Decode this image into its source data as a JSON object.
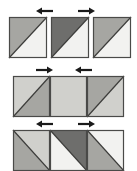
{
  "figure": {
    "type": "patchwork-pressing-diagram",
    "canvas": {
      "width": 137,
      "height": 171,
      "background": "#ffffff"
    },
    "colors": {
      "light": "#f2f2f0",
      "light_gray": "#d0d0cc",
      "medium_gray": "#a6a6a2",
      "dark_gray": "#6e6e6c",
      "outline": "#4a4a48",
      "arrow": "#1a1a1a",
      "seam_line": "#3c3c3a"
    },
    "rows": [
      {
        "name": "row-1-separate-units",
        "label": "Row 1 - three separate half-square triangle units",
        "joined": false,
        "y": 17,
        "x": 9,
        "unit_width": 38,
        "unit_height": 41,
        "gap": 4,
        "units": [
          {
            "name": "unit-1-1",
            "diagonal": "tr-bl",
            "upper_fill": "medium_gray",
            "lower_fill": "light"
          },
          {
            "name": "unit-1-2",
            "diagonal": "tr-bl",
            "upper_fill": "dark_gray",
            "lower_fill": "light"
          },
          {
            "name": "unit-1-3",
            "diagonal": "tr-bl",
            "upper_fill": "medium_gray",
            "lower_fill": "light"
          }
        ],
        "arrows": [
          {
            "name": "arrow-row1-left",
            "direction": "left",
            "x": 36,
            "y": 11,
            "length": 17
          },
          {
            "name": "arrow-row1-right",
            "direction": "right",
            "x": 78,
            "y": 11,
            "length": 17
          }
        ]
      },
      {
        "name": "row-2-joined-strip-light",
        "label": "Row 2 - units joined into a strip, seams pressed inward",
        "joined": true,
        "y": 76,
        "x": 13,
        "unit_width": 37,
        "unit_height": 41,
        "gap": 0,
        "units": [
          {
            "name": "unit-2-1",
            "diagonal": "tr-bl",
            "upper_fill": "light_gray",
            "lower_fill": "medium_gray"
          },
          {
            "name": "unit-2-2",
            "diagonal": "none",
            "upper_fill": "light_gray",
            "lower_fill": "light_gray"
          },
          {
            "name": "unit-2-3",
            "diagonal": "tr-bl",
            "upper_fill": "medium_gray",
            "lower_fill": "light_gray"
          }
        ],
        "arrows": [
          {
            "name": "arrow-row2-left",
            "direction": "right",
            "x": 36,
            "y": 70,
            "length": 17
          },
          {
            "name": "arrow-row2-right",
            "direction": "left",
            "x": 75,
            "y": 70,
            "length": 17
          }
        ]
      },
      {
        "name": "row-3-joined-strip-zigzag",
        "label": "Row 3 - units joined into a strip forming a zigzag, seams pressed outward",
        "joined": true,
        "y": 130,
        "x": 13,
        "unit_width": 37,
        "unit_height": 41,
        "gap": 0,
        "units": [
          {
            "name": "unit-3-1",
            "diagonal": "tl-br",
            "upper_fill": "light_gray",
            "lower_fill": "medium_gray"
          },
          {
            "name": "unit-3-2",
            "diagonal": "tl-br",
            "upper_fill": "dark_gray",
            "lower_fill": "light"
          },
          {
            "name": "unit-3-3",
            "diagonal": "tl-br",
            "upper_fill": "light",
            "lower_fill": "medium_gray"
          }
        ],
        "arrows": [
          {
            "name": "arrow-row3-left",
            "direction": "left",
            "x": 36,
            "y": 124,
            "length": 17
          },
          {
            "name": "arrow-row3-right",
            "direction": "right",
            "x": 78,
            "y": 124,
            "length": 17
          }
        ]
      }
    ]
  }
}
